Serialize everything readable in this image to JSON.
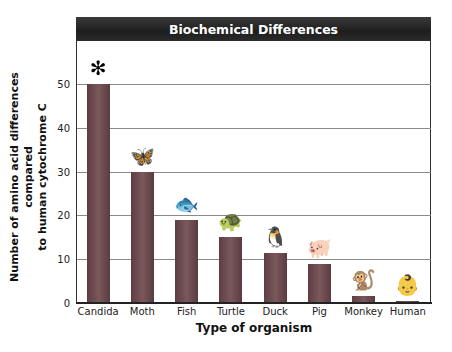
{
  "chart_data": {
    "type": "bar",
    "title": "Biochemical Differences",
    "xlabel": "Type of organism",
    "ylabel": "Number of amino acid differences compared to human cytochrome C",
    "ylabel_lines": [
      "Number of amino acid differences compared",
      "to human cytochrome C"
    ],
    "categories": [
      "Candida",
      "Moth",
      "Fish",
      "Turtle",
      "Duck",
      "Pig",
      "Monkey",
      "Human"
    ],
    "values": [
      50,
      30,
      19,
      15,
      11.5,
      9,
      1.5,
      0.5
    ],
    "yticks": [
      0,
      10,
      20,
      30,
      40,
      50
    ],
    "ylim": [
      0,
      60
    ],
    "grid": true,
    "legend": null,
    "bar_color": "#6b4a4e",
    "annotations": [
      "organism illustration above each bar"
    ]
  },
  "icons": [
    "candida-icon",
    "moth-icon",
    "fish-icon",
    "turtle-icon",
    "duck-icon",
    "pig-icon",
    "monkey-icon",
    "human-icon"
  ],
  "icon_glyphs": [
    "✻",
    "🦋",
    "🐟",
    "🐢",
    "🐧",
    "🐖",
    "🐒",
    "👶"
  ]
}
